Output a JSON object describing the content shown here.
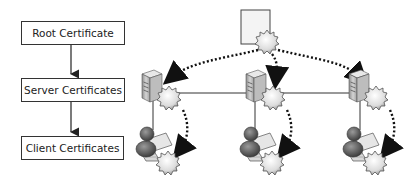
{
  "hierarchy": {
    "levels": [
      {
        "label": "Root Certificate"
      },
      {
        "label": "Server Certificates"
      },
      {
        "label": "Client Certificates"
      }
    ]
  },
  "network": {
    "root_node": {
      "icon": "certificate-document-icon",
      "badge": "seal-icon"
    },
    "servers": [
      {
        "icon": "server-icon",
        "badge": "seal-icon"
      },
      {
        "icon": "server-icon",
        "badge": "seal-icon"
      },
      {
        "icon": "server-icon",
        "badge": "seal-icon"
      }
    ],
    "clients": [
      {
        "icon": "user-laptop-icon",
        "badge": "seal-icon"
      },
      {
        "icon": "user-laptop-icon",
        "badge": "seal-icon"
      },
      {
        "icon": "user-laptop-icon",
        "badge": "seal-icon"
      }
    ]
  },
  "colors": {
    "stroke": "#333333",
    "dotted_arrow": "#222222",
    "server_fill": "#b5b5b5",
    "seal_fill": "#dedede"
  }
}
